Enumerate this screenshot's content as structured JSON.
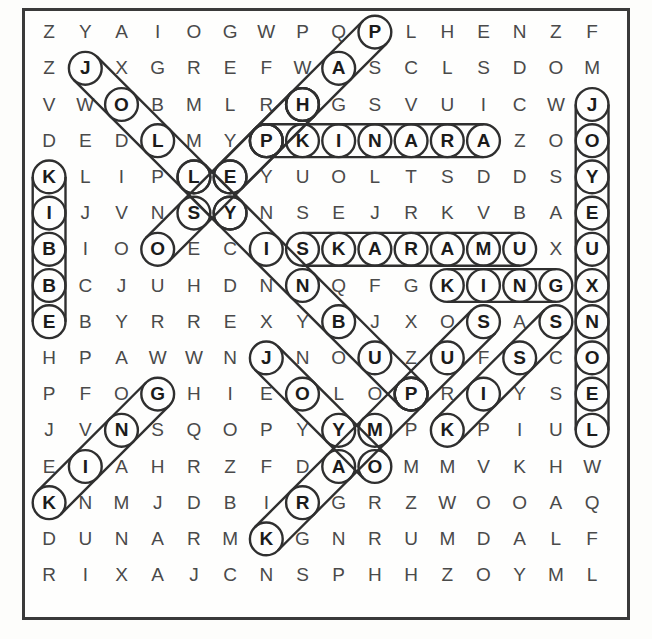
{
  "puzzle": {
    "title": "word-search-grid",
    "rows": 16,
    "cols": 16,
    "cell_size": 36.2,
    "origin_x": 31,
    "origin_y": 14,
    "ink_color": "#2f2f2f",
    "letter_color": "#4a4a4a",
    "found_letter_color": "#1b1b1b",
    "grid": [
      [
        "Z",
        "Y",
        "A",
        "I",
        "O",
        "G",
        "W",
        "P",
        "Q",
        "P",
        "L",
        "H",
        "E",
        "N",
        "Z",
        "F"
      ],
      [
        "Z",
        "J",
        "X",
        "G",
        "R",
        "E",
        "F",
        "W",
        "A",
        "S",
        "C",
        "L",
        "S",
        "D",
        "O",
        "M"
      ],
      [
        "V",
        "W",
        "O",
        "B",
        "M",
        "L",
        "R",
        "H",
        "G",
        "S",
        "V",
        "U",
        "I",
        "C",
        "W",
        "J"
      ],
      [
        "D",
        "E",
        "D",
        "L",
        "M",
        "Y",
        "P",
        "K",
        "I",
        "N",
        "A",
        "R",
        "A",
        "Z",
        "O",
        "O"
      ],
      [
        "K",
        "L",
        "I",
        "P",
        "L",
        "E",
        "Y",
        "U",
        "O",
        "L",
        "T",
        "S",
        "D",
        "D",
        "S",
        "Y"
      ],
      [
        "I",
        "J",
        "V",
        "N",
        "S",
        "Y",
        "N",
        "S",
        "E",
        "J",
        "R",
        "K",
        "V",
        "B",
        "A",
        "E"
      ],
      [
        "B",
        "I",
        "O",
        "O",
        "E",
        "C",
        "I",
        "S",
        "K",
        "A",
        "R",
        "A",
        "M",
        "U",
        "X",
        "U"
      ],
      [
        "B",
        "C",
        "J",
        "U",
        "H",
        "D",
        "N",
        "N",
        "Q",
        "F",
        "G",
        "K",
        "I",
        "N",
        "G",
        "X"
      ],
      [
        "E",
        "B",
        "Y",
        "R",
        "R",
        "E",
        "X",
        "Y",
        "B",
        "J",
        "X",
        "O",
        "S",
        "A",
        "S",
        "N"
      ],
      [
        "H",
        "P",
        "A",
        "W",
        "W",
        "N",
        "J",
        "N",
        "O",
        "U",
        "Z",
        "U",
        "F",
        "S",
        "C",
        "O"
      ],
      [
        "P",
        "F",
        "O",
        "G",
        "H",
        "I",
        "E",
        "O",
        "L",
        "O",
        "P",
        "R",
        "I",
        "Y",
        "S",
        "E"
      ],
      [
        "J",
        "V",
        "N",
        "S",
        "Q",
        "O",
        "P",
        "Y",
        "Y",
        "M",
        "P",
        "K",
        "P",
        "I",
        "U",
        "L"
      ],
      [
        "E",
        "I",
        "A",
        "H",
        "R",
        "Z",
        "F",
        "D",
        "A",
        "O",
        "M",
        "M",
        "V",
        "K",
        "H",
        "W"
      ],
      [
        "K",
        "N",
        "M",
        "J",
        "D",
        "B",
        "I",
        "R",
        "G",
        "R",
        "Z",
        "W",
        "O",
        "O",
        "A",
        "Q"
      ],
      [
        "D",
        "U",
        "N",
        "A",
        "R",
        "M",
        "K",
        "G",
        "N",
        "R",
        "U",
        "M",
        "D",
        "A",
        "L",
        "F"
      ],
      [
        "R",
        "I",
        "X",
        "A",
        "J",
        "C",
        "N",
        "S",
        "P",
        "H",
        "H",
        "Z",
        "O",
        "Y",
        "M",
        "L"
      ]
    ],
    "found_words": [
      {
        "word": "JOLLY",
        "start_row": 1,
        "start_col": 1,
        "dir": "down-right",
        "length": 5
      },
      {
        "word": "KIBBE",
        "start_row": 4,
        "start_col": 0,
        "dir": "down",
        "length": 5
      },
      {
        "word": "JOYEUXNOEL",
        "start_row": 2,
        "start_col": 15,
        "dir": "down",
        "length": 10
      },
      {
        "word": "PKINARA",
        "start_row": 3,
        "start_col": 6,
        "dir": "right",
        "length": 7
      },
      {
        "word": "SKARAMU",
        "start_row": 6,
        "start_col": 7,
        "dir": "right",
        "length": 7
      },
      {
        "word": "KING",
        "start_row": 7,
        "start_col": 11,
        "dir": "right",
        "length": 4
      },
      {
        "word": "HUS",
        "start_row": 2,
        "start_col": 7,
        "dir": "up-right",
        "length": 3
      },
      {
        "word": "ELSENJ",
        "start_row": 4,
        "start_col": 5,
        "dir": "up-right",
        "length": 3
      },
      {
        "word": "SNOWMEN",
        "start_row": 4,
        "start_col": 4,
        "dir": "down-right",
        "length": 7
      },
      {
        "word": "REINDEER",
        "start_row": 6,
        "start_col": 3,
        "dir": "up-right",
        "length": 5
      },
      {
        "word": "JOYEUX",
        "start_row": 9,
        "start_col": 6,
        "dir": "down-right",
        "length": 4
      },
      {
        "word": "KING2",
        "start_row": 13,
        "start_col": 0,
        "dir": "up-right",
        "length": 4
      },
      {
        "word": "KISS",
        "start_row": 11,
        "start_col": 11,
        "dir": "up-right",
        "length": 4
      },
      {
        "word": "PUS",
        "start_row": 10,
        "start_col": 10,
        "dir": "up-right",
        "length": 3
      },
      {
        "word": "KRAMY",
        "start_row": 14,
        "start_col": 6,
        "dir": "up-right",
        "length": 5
      }
    ]
  }
}
